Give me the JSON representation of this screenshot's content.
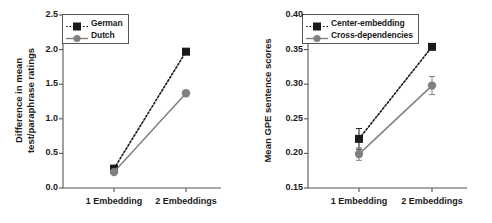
{
  "chart_data": [
    {
      "type": "line",
      "panel": "left",
      "title": "",
      "xlabel": "",
      "ylabel": "Difference in mean\ntest/paraphrase ratings",
      "ylabel_lines": [
        "Difference in mean",
        "test/paraphrase ratings"
      ],
      "categories": [
        "1 Embedding",
        "2 Embeddings"
      ],
      "ylim": [
        0.0,
        2.5
      ],
      "yticks": [
        "0.0",
        "0.5",
        "1.0",
        "1.5",
        "2.0",
        "2.5"
      ],
      "ytick_values": [
        0.0,
        0.5,
        1.0,
        1.5,
        2.0,
        2.5
      ],
      "grid": false,
      "legend_position": "top-left",
      "series": [
        {
          "name": "German",
          "values": [
            0.28,
            1.97
          ],
          "errors": [
            0.0,
            0.0
          ],
          "color": "#1a1a1a",
          "marker": "square",
          "linestyle": "dotted"
        },
        {
          "name": "Dutch",
          "values": [
            0.23,
            1.37
          ],
          "errors": [
            0.0,
            0.0
          ],
          "color": "#808080",
          "marker": "circle",
          "linestyle": "solid"
        }
      ]
    },
    {
      "type": "line",
      "panel": "right",
      "title": "",
      "xlabel": "",
      "ylabel": "Mean GPE sentence scores",
      "ylabel_lines": [
        "Mean GPE sentence scores"
      ],
      "categories": [
        "1 Embedding",
        "2 Embeddings"
      ],
      "ylim": [
        0.15,
        0.4
      ],
      "yticks": [
        "0.15",
        "0.20",
        "0.25",
        "0.30",
        "0.35",
        "0.40"
      ],
      "ytick_values": [
        0.15,
        0.2,
        0.25,
        0.3,
        0.35,
        0.4
      ],
      "grid": false,
      "legend_position": "top-left",
      "series": [
        {
          "name": "Center-embedding",
          "values": [
            0.221,
            0.354
          ],
          "errors": [
            0.015,
            0.004
          ],
          "color": "#1a1a1a",
          "marker": "square",
          "linestyle": "dotted"
        },
        {
          "name": "Cross-dependencies",
          "values": [
            0.199,
            0.298
          ],
          "errors": [
            0.009,
            0.013
          ],
          "color": "#808080",
          "marker": "circle",
          "linestyle": "solid"
        }
      ]
    }
  ],
  "colors": {
    "series_1": "#1a1a1a",
    "series_2": "#808080",
    "axis": "#555555",
    "background": "#ffffff"
  }
}
